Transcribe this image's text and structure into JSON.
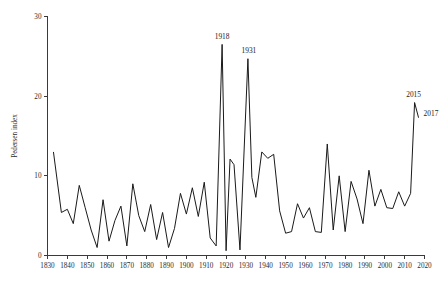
{
  "chart_data": {
    "type": "line",
    "title": "",
    "xlabel": "",
    "ylabel": "Pedersen index",
    "xlim": [
      1830,
      2020
    ],
    "ylim": [
      0,
      30
    ],
    "grid": false,
    "legend": null,
    "xticks": [
      1830,
      1840,
      1850,
      1860,
      1870,
      1880,
      1890,
      1900,
      1910,
      1920,
      1930,
      1940,
      1950,
      1960,
      1970,
      1980,
      1990,
      2000,
      2010,
      2020
    ],
    "yticks": [
      0,
      10,
      20,
      30
    ],
    "series": [
      {
        "name": "Pedersen index",
        "color": "#1a1a1a",
        "x": [
          1833,
          1837,
          1840,
          1843,
          1846,
          1849,
          1852,
          1855,
          1858,
          1861,
          1864,
          1867,
          1870,
          1873,
          1876,
          1879,
          1882,
          1885,
          1888,
          1891,
          1894,
          1897,
          1900,
          1903,
          1906,
          1909,
          1912,
          1915,
          1918,
          1920,
          1922,
          1924,
          1927,
          1931,
          1933,
          1935,
          1938,
          1941,
          1944,
          1947,
          1950,
          1953,
          1956,
          1959,
          1962,
          1965,
          1968,
          1971,
          1974,
          1977,
          1980,
          1983,
          1986,
          1989,
          1992,
          1995,
          1998,
          2001,
          2004,
          2007,
          2010,
          2013,
          2015,
          2017
        ],
        "values": [
          13.0,
          5.4,
          5.8,
          4.0,
          8.8,
          6.0,
          3.2,
          1.0,
          7.0,
          1.8,
          4.4,
          6.2,
          1.2,
          9.0,
          5.0,
          3.0,
          6.4,
          2.0,
          5.4,
          1.0,
          3.4,
          7.8,
          5.2,
          8.5,
          4.9,
          9.2,
          2.2,
          1.2,
          26.5,
          0.6,
          12.1,
          11.4,
          0.7,
          24.7,
          9.8,
          7.3,
          13.0,
          12.2,
          12.7,
          5.6,
          2.8,
          3.0,
          6.5,
          4.7,
          6.0,
          3.0,
          2.9,
          14.0,
          3.2,
          10.0,
          3.0,
          9.3,
          7.1,
          4.0,
          10.7,
          6.2,
          8.3,
          6.0,
          5.9,
          8.0,
          6.2,
          7.8,
          19.2,
          17.3
        ]
      }
    ],
    "annotations": [
      {
        "label": "1918",
        "x": 1918,
        "y": 26.5,
        "dx": 0,
        "dy": -5.5,
        "align": "middle"
      },
      {
        "label": "1931",
        "x": 1931,
        "y": 24.7,
        "dx": 1,
        "dy": -5.5,
        "align": "middle"
      },
      {
        "label": "2015",
        "x": 2015,
        "y": 19.2,
        "dx": -1,
        "dy": -5.5,
        "align": "middle"
      },
      {
        "label": "2017",
        "x": 2017,
        "y": 17.3,
        "dx": 5,
        "dy": -2.0,
        "align": "start"
      }
    ]
  },
  "axis": {
    "y_title": "Pedersen index",
    "x_tick_labels": [
      "1830",
      "1840",
      "1850",
      "1860",
      "1870",
      "1880",
      "1890",
      "1900",
      "1910",
      "1920",
      "1930",
      "1940",
      "1950",
      "1960",
      "1970",
      "1980",
      "1990",
      "2000",
      "2010",
      "2020"
    ],
    "y_tick_labels": [
      "0",
      "10",
      "20",
      "30"
    ]
  }
}
